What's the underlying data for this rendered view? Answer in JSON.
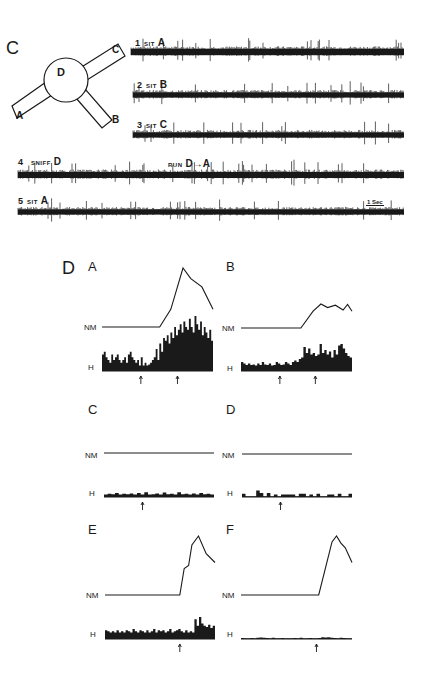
{
  "figure": {
    "panel_c": {
      "label": "C",
      "maze": {
        "center_label": "D",
        "arm_labels": [
          "A",
          "B",
          "C"
        ]
      },
      "traces": [
        {
          "num": "1",
          "action": "SIT",
          "location": "A"
        },
        {
          "num": "2",
          "action": "SIT",
          "location": "B"
        },
        {
          "num": "3",
          "action": "SIT",
          "location": "C"
        },
        {
          "num": "4",
          "action": "SNIFF",
          "location": "D",
          "action2": "RUN",
          "location2": "D→A"
        },
        {
          "num": "5",
          "action": "SIT",
          "location": "A"
        }
      ],
      "scale_bar": "1 Sec"
    },
    "panel_d": {
      "label": "D",
      "row_labels": {
        "nm": "NM",
        "h": "H"
      },
      "subpanels": [
        {
          "id": "A"
        },
        {
          "id": "B"
        },
        {
          "id": "C"
        },
        {
          "id": "D"
        },
        {
          "id": "E"
        },
        {
          "id": "F"
        }
      ]
    }
  },
  "chart_data": [
    {
      "type": "line",
      "title": "D-A NM",
      "description": "Neuron model activity: flat baseline then rise to peak and decline",
      "x": [
        0,
        0.52,
        0.62,
        0.73,
        0.8,
        0.9,
        1.0
      ],
      "values": [
        0,
        0,
        0.3,
        1.0,
        0.82,
        0.68,
        0.3
      ]
    },
    {
      "type": "bar",
      "title": "D-A H",
      "description": "Histogram: low activity then sharply increased after first arrow",
      "arrows_at": [
        0.35,
        0.68
      ],
      "values": [
        0.3,
        0.35,
        0.25,
        0.2,
        0.15,
        0.3,
        0.2,
        0.25,
        0.3,
        0.2,
        0.15,
        0.2,
        0.25,
        0.15,
        0.3,
        0.35,
        0.25,
        0.2,
        0.15,
        0.2,
        0.1,
        0.25,
        0.1,
        0.15,
        0.1,
        0.12,
        0.15,
        0.2,
        0.25,
        0.4,
        0.2,
        0.5,
        0.35,
        0.6,
        0.55,
        0.65,
        0.5,
        0.7,
        0.6,
        0.8,
        0.65,
        0.75,
        0.85,
        0.7,
        0.9,
        0.8,
        0.75,
        0.95,
        0.8,
        0.7,
        1.0,
        0.85,
        0.75,
        0.9,
        0.65,
        0.8,
        0.7,
        0.6,
        0.75,
        0.55
      ]
    },
    {
      "type": "line",
      "title": "D-B NM",
      "x": [
        0,
        0.54,
        0.65,
        0.72,
        0.78,
        0.85,
        0.92,
        0.96,
        1.0
      ],
      "values": [
        0,
        0,
        0.7,
        1.0,
        0.85,
        0.95,
        0.75,
        0.98,
        0.7
      ]
    },
    {
      "type": "bar",
      "title": "D-B H",
      "arrows_at": [
        0.35,
        0.67
      ],
      "values": [
        0.3,
        0.25,
        0.2,
        0.25,
        0.2,
        0.22,
        0.18,
        0.25,
        0.2,
        0.3,
        0.22,
        0.2,
        0.25,
        0.18,
        0.2,
        0.3,
        0.25,
        0.2,
        0.22,
        0.3,
        0.25,
        0.2,
        0.3,
        0.35,
        0.3,
        0.4,
        0.45,
        0.8,
        0.6,
        0.75,
        0.55,
        0.6,
        0.5,
        0.55,
        0.9,
        0.6,
        0.7,
        0.55,
        0.65,
        0.45,
        0.7,
        0.55,
        0.85,
        0.9,
        0.75,
        0.6,
        0.5,
        0.45
      ]
    },
    {
      "type": "line",
      "title": "D-C NM",
      "x": [
        0,
        1
      ],
      "values": [
        0,
        0
      ]
    },
    {
      "type": "bar",
      "title": "D-C H",
      "arrows_at": [
        0.35
      ],
      "values": [
        0.3,
        0.4,
        0.35,
        0.5,
        0.3,
        0.4,
        0.35,
        0.45,
        0.3,
        0.5,
        0.3,
        0.6,
        0.3,
        0.35,
        0.45,
        0.3,
        0.55,
        0.35,
        0.4,
        0.3,
        0.6,
        0.35,
        0.4,
        0.3,
        0.45,
        0.3,
        0.5,
        0.35,
        0.4,
        0.3
      ]
    },
    {
      "type": "line",
      "title": "D-D NM",
      "x": [
        0,
        1
      ],
      "values": [
        0,
        0
      ]
    },
    {
      "type": "bar",
      "title": "D-D H",
      "arrows_at": [
        0.35
      ],
      "values": [
        0.4,
        0,
        0,
        0,
        0.8,
        0.5,
        0,
        0.5,
        0,
        0.3,
        0,
        0.3,
        0.3,
        0.3,
        0.3,
        0,
        0.4,
        0.4,
        0,
        0.3,
        0,
        0.4,
        0,
        0,
        0.3,
        0.3,
        0,
        0.4,
        0,
        0,
        0.4
      ]
    },
    {
      "type": "line",
      "title": "D-E NM",
      "x": [
        0,
        0.68,
        0.72,
        0.76,
        0.79,
        0.85,
        0.92,
        1.0
      ],
      "values": [
        0,
        0,
        0.45,
        0.5,
        0.85,
        1.0,
        0.7,
        0.55
      ]
    },
    {
      "type": "bar",
      "title": "D-E H",
      "arrows_at": [
        0.68
      ],
      "values": [
        0.4,
        0.35,
        0.3,
        0.35,
        0.3,
        0.4,
        0.3,
        0.35,
        0.3,
        0.4,
        0.35,
        0.3,
        0.45,
        0.35,
        0.3,
        0.4,
        0.35,
        0.3,
        0.4,
        0.3,
        0.35,
        0.45,
        0.3,
        0.4,
        0.35,
        0.4,
        0.3,
        0.35,
        0.45,
        0.3,
        0.35,
        0.4,
        0.45,
        0.35,
        0.3,
        0.4,
        0.3,
        0.35,
        0.3,
        0.9,
        0.6,
        1.0,
        0.7,
        0.6,
        0.55,
        0.65,
        0.5,
        0.6
      ]
    },
    {
      "type": "line",
      "title": "D-F NM",
      "x": [
        0,
        0.7,
        0.82,
        0.86,
        0.9,
        0.94,
        1.0
      ],
      "values": [
        0,
        0,
        0.9,
        1.0,
        0.88,
        0.8,
        0.55
      ]
    },
    {
      "type": "bar",
      "title": "D-F H",
      "arrows_at": [
        0.68
      ],
      "values": [
        0.15,
        0,
        0.1,
        0.15,
        0,
        0.2,
        0.25,
        0.2,
        0.15,
        0,
        0.2,
        0.1,
        0,
        0.15,
        0.1,
        0,
        0,
        0.15,
        0.1,
        0.2,
        0,
        0.1,
        0.15,
        0.1,
        0,
        0.15,
        0.3,
        0.25,
        0.3,
        0.2,
        0.15,
        0,
        0.2,
        0.15,
        0,
        0.1
      ]
    }
  ]
}
